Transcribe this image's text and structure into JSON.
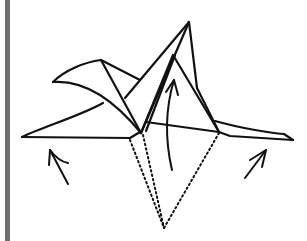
{
  "diagram": {
    "title": "Origami folding step",
    "description": "Line drawing of a partially folded origami model with two wing flaps and a raised central point; dotted valley lines converge at a point below, with arrows indicating the flaps to be lifted.",
    "colors": {
      "stroke": "#111111",
      "side_bar": "#6e6e6e",
      "background": "#ffffff"
    },
    "arrows": [
      {
        "name": "left-lift-arrow",
        "direction": "up-left"
      },
      {
        "name": "center-lift-arrow",
        "direction": "up"
      },
      {
        "name": "right-lift-arrow",
        "direction": "up-right"
      }
    ],
    "fold_lines": {
      "type": "dotted",
      "count": 3,
      "converge": "bottom-center"
    }
  }
}
